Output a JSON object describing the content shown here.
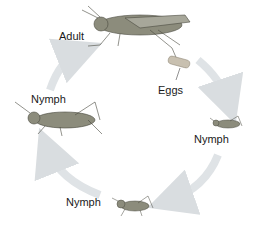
{
  "diagram": {
    "stages": [
      {
        "id": "adult",
        "label": "Adult"
      },
      {
        "id": "eggs",
        "label": "Eggs"
      },
      {
        "id": "nymph1",
        "label": "Nymph"
      },
      {
        "id": "nymph2",
        "label": "Nymph"
      },
      {
        "id": "nymph3",
        "label": "Nymph"
      }
    ],
    "cycle_direction": "clockwise",
    "colors": {
      "arrow": "#d9dde0",
      "insect": "#8a8a7a",
      "text": "#1a1a1a"
    }
  }
}
